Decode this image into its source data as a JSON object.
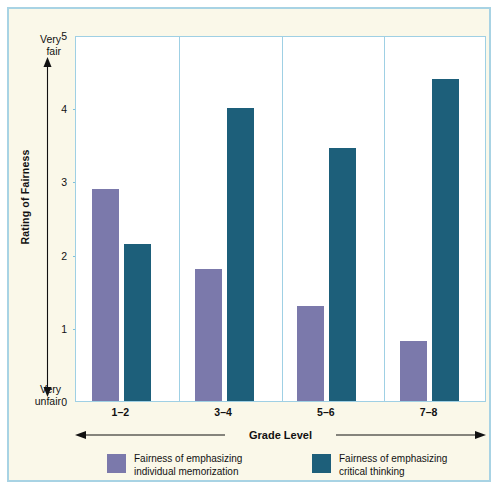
{
  "chart_data": {
    "type": "bar",
    "title": "",
    "xlabel": "Grade Level",
    "ylabel": "Rating of Fairness",
    "categories": [
      "1–2",
      "3–4",
      "5–6",
      "7–8"
    ],
    "series": [
      {
        "name": "Fairness of emphasizing\nindividual memorization",
        "color": "#7b79ab",
        "values": [
          2.9,
          1.8,
          1.3,
          0.82
        ]
      },
      {
        "name": "Fairness of emphasizing\ncritical thinking",
        "color": "#1d5f7a",
        "values": [
          2.15,
          4.0,
          3.45,
          4.4
        ]
      }
    ],
    "ylim": [
      0,
      5
    ],
    "yticks": [
      "0",
      "1",
      "2",
      "3",
      "4",
      "5"
    ],
    "y_axis_high_label": "Very\nfair",
    "y_axis_low_label": "Very\nunfair",
    "grid": false,
    "legend_position": "bottom"
  },
  "axes": {
    "y_title": "Rating of Fairness",
    "x_title": "Grade Level",
    "very_fair": "Very\nfair",
    "very_unfair": "Very\nunfair"
  },
  "colors": {
    "memorization": "#7b79ab",
    "thinking": "#1d5f7a",
    "frame": "#a8d3e4",
    "background": "#faf8e9",
    "plot_background": "#ffffff"
  }
}
